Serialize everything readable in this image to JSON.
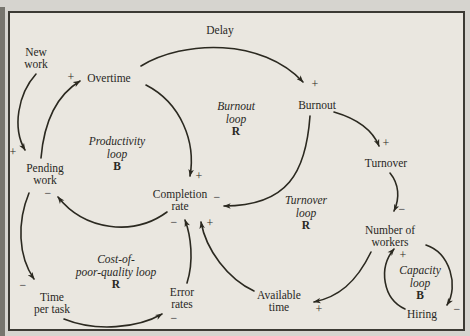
{
  "colors": {
    "background": "#d6d4cf",
    "panel": "#eae7e0",
    "panel_border": "#3c3a34",
    "ink": "#2b2920",
    "scan_strip": "#77756e"
  },
  "diagram": {
    "delay_label": "Delay",
    "nodes": [
      {
        "id": "new-work",
        "lines": [
          "New",
          "work"
        ],
        "x": 36,
        "y": 58
      },
      {
        "id": "overtime",
        "lines": [
          "Overtime"
        ],
        "x": 109,
        "y": 78
      },
      {
        "id": "pending-work",
        "lines": [
          "Pending",
          "work"
        ],
        "x": 45,
        "y": 174
      },
      {
        "id": "completion-rate",
        "lines": [
          "Completion",
          "rate"
        ],
        "x": 180,
        "y": 200
      },
      {
        "id": "burnout",
        "lines": [
          "Burnout"
        ],
        "x": 317,
        "y": 105
      },
      {
        "id": "turnover",
        "lines": [
          "Turnover"
        ],
        "x": 386,
        "y": 163
      },
      {
        "id": "number-of-workers",
        "lines": [
          "Number of",
          "workers"
        ],
        "x": 390,
        "y": 236
      },
      {
        "id": "available-time",
        "lines": [
          "Available",
          "time"
        ],
        "x": 279,
        "y": 301
      },
      {
        "id": "error-rates",
        "lines": [
          "Error",
          "rates"
        ],
        "x": 182,
        "y": 298
      },
      {
        "id": "time-per-task",
        "lines": [
          "Time",
          "per task"
        ],
        "x": 52,
        "y": 303
      },
      {
        "id": "hiring",
        "lines": [
          "Hiring"
        ],
        "x": 422,
        "y": 314
      }
    ],
    "loops": [
      {
        "id": "productivity-loop",
        "lines": [
          "Productivity",
          "loop"
        ],
        "letter": "B",
        "x": 117,
        "y": 154
      },
      {
        "id": "burnout-loop",
        "lines": [
          "Burnout",
          "loop"
        ],
        "letter": "R",
        "x": 236,
        "y": 119
      },
      {
        "id": "turnover-loop",
        "lines": [
          "Turnover",
          "loop"
        ],
        "letter": "R",
        "x": 306,
        "y": 213
      },
      {
        "id": "capacity-loop",
        "lines": [
          "Capacity",
          "loop"
        ],
        "letter": "B",
        "x": 420,
        "y": 283
      },
      {
        "id": "cost-of-poor-quality-loop",
        "lines": [
          "Cost-of-",
          "poor-quality loop"
        ],
        "letter": "R",
        "x": 116,
        "y": 272
      }
    ],
    "edges": [
      {
        "from": "new-work",
        "to": "pending-work",
        "path": "M 36 74 C 18 94, 12 128, 25 150"
      },
      {
        "from": "pending-work",
        "to": "overtime",
        "path": "M 41 158 C 44 122, 57 95, 80 81"
      },
      {
        "from": "overtime",
        "to": "burnout",
        "path": "M 141 66 C 184 40, 262 38, 303 82"
      },
      {
        "from": "overtime",
        "to": "completion-rate",
        "path": "M 146 85 C 181 103, 196 142, 190 176"
      },
      {
        "from": "completion-rate",
        "to": "pending-work",
        "path": "M 167 212 C 133 237, 84 230, 58 197"
      },
      {
        "from": "burnout",
        "to": "completion-rate",
        "path": "M 310 116 C 306 172, 288 206, 224 206"
      },
      {
        "from": "burnout",
        "to": "turnover",
        "path": "M 334 112 C 358 119, 373 131, 379 146"
      },
      {
        "from": "turnover",
        "to": "number-of-workers",
        "path": "M 390 173 C 399 184, 400 198, 394 211"
      },
      {
        "from": "number-of-workers",
        "to": "available-time",
        "path": "M 371 252 C 356 283, 338 297, 314 302"
      },
      {
        "from": "available-time",
        "to": "completion-rate",
        "path": "M 254 291 C 228 279, 206 250, 201 222"
      },
      {
        "from": "error-rates",
        "to": "completion-rate",
        "path": "M 187 283 C 194 261, 191 236, 185 220"
      },
      {
        "from": "time-per-task",
        "to": "error-rates",
        "path": "M 64 319 C 96 332, 138 328, 162 314"
      },
      {
        "from": "pending-work",
        "to": "time-per-task",
        "path": "M 29 193 C 17 222, 18 256, 34 279"
      },
      {
        "from": "hiring",
        "to": "number-of-workers",
        "path": "M 405 309 C 383 299, 378 268, 394 249"
      },
      {
        "from": "number-of-workers",
        "to": "hiring",
        "path": "M 426 245 C 450 253, 459 286, 447 305"
      }
    ],
    "signs": [
      {
        "edge": "new-work-to-pending-work",
        "text": "+",
        "x": 13,
        "y": 152
      },
      {
        "edge": "pending-work-to-overtime",
        "text": "+",
        "x": 71,
        "y": 77
      },
      {
        "edge": "overtime-to-burnout",
        "text": "+",
        "x": 315,
        "y": 84
      },
      {
        "edge": "overtime-to-completion-rate",
        "text": "+",
        "x": 199,
        "y": 176
      },
      {
        "edge": "completion-rate-to-pending-work",
        "text": "−",
        "x": 48,
        "y": 193
      },
      {
        "edge": "burnout-to-completion-rate",
        "text": "−",
        "x": 217,
        "y": 197
      },
      {
        "edge": "burnout-to-turnover",
        "text": "+",
        "x": 386,
        "y": 143
      },
      {
        "edge": "turnover-to-number-of-workers",
        "text": "−",
        "x": 402,
        "y": 209
      },
      {
        "edge": "number-of-workers-to-available-time",
        "text": "+",
        "x": 319,
        "y": 309
      },
      {
        "edge": "available-time-to-completion-rate",
        "text": "+",
        "x": 210,
        "y": 223
      },
      {
        "edge": "error-rates-to-completion-rate",
        "text": "−",
        "x": 174,
        "y": 222
      },
      {
        "edge": "time-per-task-to-error-rates",
        "text": "−",
        "x": 174,
        "y": 318
      },
      {
        "edge": "pending-work-to-time-per-task",
        "text": "−",
        "x": 23,
        "y": 285
      },
      {
        "edge": "hiring-to-number-of-workers",
        "text": "+",
        "x": 403,
        "y": 255
      },
      {
        "edge": "number-of-workers-to-hiring",
        "text": "−",
        "x": 457,
        "y": 309
      }
    ]
  }
}
